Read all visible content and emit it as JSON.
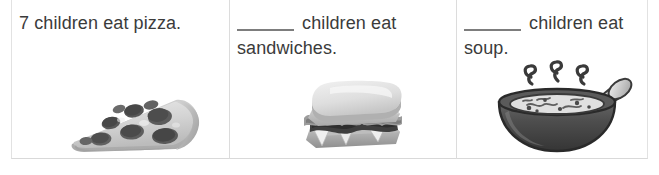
{
  "document": {
    "type": "worksheet-table",
    "columns": 3,
    "rows": 1,
    "background_color": "#ffffff",
    "border_color": "#dcdcdc",
    "text_color": "#3b3b3b"
  },
  "cells": [
    {
      "id": "pizza",
      "sentence_prefix": "7",
      "has_blank": false,
      "sentence_body": " children eat pizza.",
      "full_text": "7 children eat pizza.",
      "illustration": "pizza-slice-image",
      "illustration_label": "pepperoni pizza slice"
    },
    {
      "id": "sandwiches",
      "sentence_prefix": "",
      "has_blank": true,
      "sentence_body": " children eat sandwiches.",
      "full_text": "_____ children eat sandwiches.",
      "illustration": "sandwich-image",
      "illustration_label": "stacked deli sandwich"
    },
    {
      "id": "soup",
      "sentence_prefix": "",
      "has_blank": true,
      "sentence_body": " children eat soup.",
      "full_text": "_____ children eat soup.",
      "illustration": "soup-bowl-image",
      "illustration_label": "steaming bowl of soup with spoon"
    }
  ]
}
